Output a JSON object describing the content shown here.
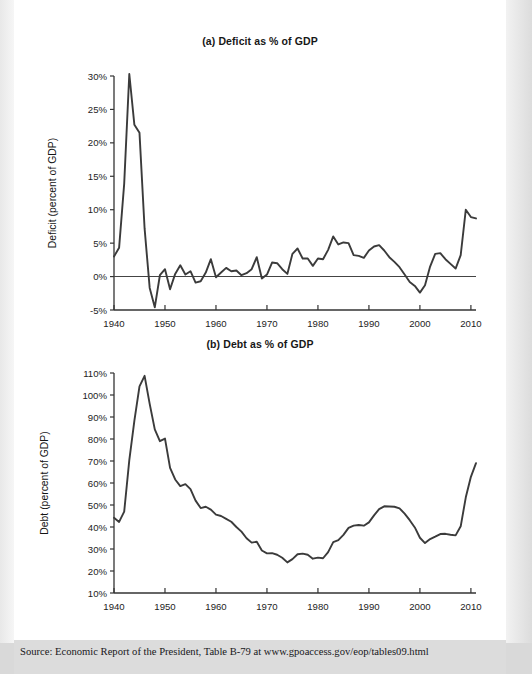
{
  "figure": {
    "source_note": "Source: Economic Report of the President, Table B-79 at www.gpoaccess.gov/eop/tables09.html"
  },
  "chart_data": [
    {
      "type": "line",
      "panel": "a",
      "title": "(a) Deficit as % of GDP",
      "xlabel": "",
      "ylabel": "Deficit (percent of GDP)",
      "xlim": [
        1940,
        2011
      ],
      "ylim": [
        -5,
        30
      ],
      "grid": false,
      "legend": "none",
      "zero_line": true,
      "y_ticks": [
        -5,
        0,
        5,
        10,
        15,
        20,
        25,
        30
      ],
      "y_ticklabels": [
        "-5%",
        "0%",
        "5%",
        "10%",
        "15%",
        "20%",
        "25%",
        "30%"
      ],
      "x_ticks": [
        1940,
        1950,
        1960,
        1970,
        1980,
        1990,
        2000,
        2010
      ],
      "x_ticklabels": [
        "1940",
        "1950",
        "1960",
        "1970",
        "1980",
        "1990",
        "2000",
        "2010"
      ],
      "series": [
        {
          "name": "Deficit (percent of GDP)",
          "color": "#3b3b3b",
          "x": [
            1940,
            1941,
            1942,
            1943,
            1944,
            1945,
            1946,
            1947,
            1948,
            1949,
            1950,
            1951,
            1952,
            1953,
            1954,
            1955,
            1956,
            1957,
            1958,
            1959,
            1960,
            1961,
            1962,
            1963,
            1964,
            1965,
            1966,
            1967,
            1968,
            1969,
            1970,
            1971,
            1972,
            1973,
            1974,
            1975,
            1976,
            1977,
            1978,
            1979,
            1980,
            1981,
            1982,
            1983,
            1984,
            1985,
            1986,
            1987,
            1988,
            1989,
            1990,
            1991,
            1992,
            1993,
            1994,
            1995,
            1996,
            1997,
            1998,
            1999,
            2000,
            2001,
            2002,
            2003,
            2004,
            2005,
            2006,
            2007,
            2008,
            2009,
            2010,
            2011
          ],
          "values": [
            3.0,
            4.3,
            13.9,
            30.3,
            22.7,
            21.5,
            7.2,
            -1.7,
            -4.6,
            0.2,
            1.1,
            -1.9,
            0.4,
            1.7,
            0.3,
            0.8,
            -0.9,
            -0.7,
            0.6,
            2.6,
            -0.1,
            0.6,
            1.3,
            0.8,
            0.9,
            0.2,
            0.5,
            1.1,
            2.9,
            -0.3,
            0.3,
            2.1,
            2.0,
            1.1,
            0.4,
            3.4,
            4.2,
            2.7,
            2.7,
            1.6,
            2.7,
            2.6,
            4.0,
            6.0,
            4.8,
            5.1,
            5.0,
            3.2,
            3.1,
            2.8,
            3.9,
            4.5,
            4.7,
            3.9,
            2.9,
            2.2,
            1.4,
            0.3,
            -0.8,
            -1.4,
            -2.4,
            -1.3,
            1.5,
            3.4,
            3.5,
            2.6,
            1.9,
            1.2,
            3.2,
            10.0,
            8.9,
            8.7
          ]
        }
      ]
    },
    {
      "type": "line",
      "panel": "b",
      "title": "(b) Debt as % of GDP",
      "xlabel": "",
      "ylabel": "Debt (percent of GDP)",
      "xlim": [
        1940,
        2011
      ],
      "ylim": [
        10,
        110
      ],
      "grid": false,
      "legend": "none",
      "zero_line": false,
      "y_ticks": [
        10,
        20,
        30,
        40,
        50,
        60,
        70,
        80,
        90,
        100,
        110
      ],
      "y_ticklabels": [
        "10%",
        "20%",
        "30%",
        "40%",
        "50%",
        "60%",
        "70%",
        "80%",
        "90%",
        "100%",
        "110%"
      ],
      "x_ticks": [
        1940,
        1950,
        1960,
        1970,
        1980,
        1990,
        2000,
        2010
      ],
      "x_ticklabels": [
        "1940",
        "1950",
        "1960",
        "1970",
        "1980",
        "1990",
        "2000",
        "2010"
      ],
      "series": [
        {
          "name": "Debt (percent of GDP)",
          "color": "#3b3b3b",
          "x": [
            1940,
            1941,
            1942,
            1943,
            1944,
            1945,
            1946,
            1947,
            1948,
            1949,
            1950,
            1951,
            1952,
            1953,
            1954,
            1955,
            1956,
            1957,
            1958,
            1959,
            1960,
            1961,
            1962,
            1963,
            1964,
            1965,
            1966,
            1967,
            1968,
            1969,
            1970,
            1971,
            1972,
            1973,
            1974,
            1975,
            1976,
            1977,
            1978,
            1979,
            1980,
            1981,
            1982,
            1983,
            1984,
            1985,
            1986,
            1987,
            1988,
            1989,
            1990,
            1991,
            1992,
            1993,
            1994,
            1995,
            1996,
            1997,
            1998,
            1999,
            2000,
            2001,
            2002,
            2003,
            2004,
            2005,
            2006,
            2007,
            2008,
            2009,
            2010,
            2011
          ],
          "values": [
            44.2,
            42.3,
            47.0,
            70.4,
            88.3,
            103.9,
            108.7,
            96.0,
            84.4,
            79.0,
            80.2,
            66.9,
            61.6,
            58.6,
            59.5,
            57.2,
            52.0,
            48.6,
            49.2,
            47.9,
            45.6,
            45.0,
            43.7,
            42.4,
            40.0,
            37.9,
            34.9,
            32.9,
            33.3,
            29.3,
            28.0,
            28.1,
            27.4,
            26.0,
            23.9,
            25.4,
            27.6,
            27.9,
            27.4,
            25.6,
            26.1,
            25.8,
            28.6,
            33.1,
            34.0,
            36.4,
            39.6,
            40.6,
            40.9,
            40.6,
            42.1,
            45.3,
            48.1,
            49.4,
            49.3,
            49.2,
            48.5,
            46.1,
            43.1,
            39.8,
            35.1,
            32.7,
            34.5,
            35.6,
            36.8,
            36.9,
            36.5,
            36.2,
            40.3,
            53.5,
            62.8,
            69.0
          ]
        }
      ]
    }
  ]
}
